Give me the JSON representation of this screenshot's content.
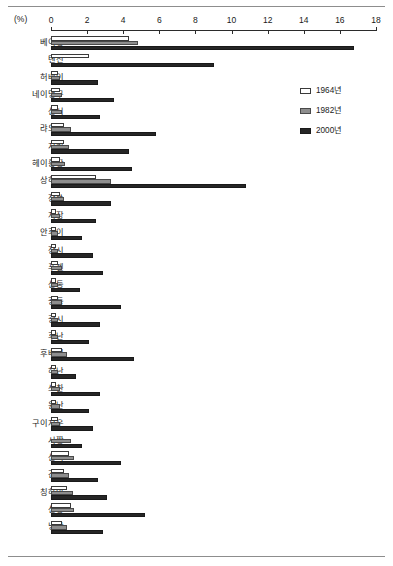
{
  "chart_data": {
    "type": "bar",
    "orientation": "horizontal",
    "title": "",
    "xlabel": "(%)",
    "ylabel": "",
    "xlim": [
      0,
      18
    ],
    "xticks": [
      0,
      2,
      4,
      6,
      8,
      10,
      12,
      14,
      16,
      18
    ],
    "grid": false,
    "legend_position": "upper-right",
    "categories": [
      "베이징",
      "톈진",
      "허베이",
      "네이멍구",
      "산시",
      "랴오닝",
      "지린",
      "헤이룽장",
      "상하이",
      "장쑤",
      "저장",
      "안후이",
      "장시",
      "푸젠",
      "산둥",
      "광둥",
      "광시",
      "후난",
      "후베이",
      "허난",
      "쓰촨",
      "윈난",
      "구이저우",
      "시짱",
      "산시",
      "간쑤",
      "칭하이",
      "신장",
      "닝샤"
    ],
    "series": [
      {
        "name": "1964년",
        "color": "#ffffff",
        "values": [
          4.3,
          2.1,
          0.4,
          0.5,
          0.4,
          0.7,
          0.7,
          0.5,
          2.5,
          0.5,
          0.3,
          0.3,
          0.3,
          0.4,
          0.3,
          0.4,
          0.3,
          0.3,
          0.6,
          0.3,
          0.3,
          0.3,
          0.4,
          0.0,
          1.0,
          0.7,
          0.9,
          1.1,
          0.6
        ]
      },
      {
        "name": "1982년",
        "color": "#8e8e8e",
        "values": [
          4.8,
          0.0,
          0.5,
          0.6,
          0.6,
          1.1,
          1.0,
          0.8,
          3.3,
          0.7,
          0.5,
          0.4,
          0.4,
          0.6,
          0.4,
          0.6,
          0.4,
          0.4,
          0.9,
          0.4,
          0.5,
          0.5,
          0.5,
          1.1,
          1.3,
          1.0,
          1.2,
          1.3,
          0.9
        ]
      },
      {
        "name": "2000년",
        "color": "#262626",
        "values": [
          16.8,
          9.0,
          2.6,
          3.5,
          2.7,
          5.8,
          4.3,
          4.5,
          10.8,
          3.3,
          2.5,
          1.7,
          2.3,
          2.9,
          1.6,
          3.9,
          2.7,
          2.1,
          4.6,
          1.4,
          2.7,
          2.1,
          2.3,
          1.7,
          3.9,
          2.6,
          3.1,
          5.2,
          2.9
        ]
      }
    ]
  },
  "legend": {
    "items": [
      {
        "label": "1964년"
      },
      {
        "label": "1982년"
      },
      {
        "label": "2000년"
      }
    ]
  }
}
